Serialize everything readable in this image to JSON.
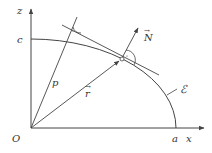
{
  "diagram": {
    "labels": {
      "z_axis": "z",
      "x_axis": "x",
      "origin": "O",
      "c": "c",
      "a": "a",
      "p": "p",
      "r": "r",
      "N": "N",
      "curve": "ℰ"
    },
    "colors": {
      "stroke": "#444444",
      "text": "#333333",
      "background": "#ffffff"
    },
    "geometry": {
      "origin": [
        31,
        128
      ],
      "z_axis_top": [
        31,
        8
      ],
      "x_axis_right": [
        205,
        128
      ],
      "c_point": [
        31,
        39
      ],
      "a_point": [
        176,
        128
      ],
      "tangent_point": [
        121,
        59
      ],
      "perpendicular_foot": [
        69,
        38
      ]
    }
  }
}
